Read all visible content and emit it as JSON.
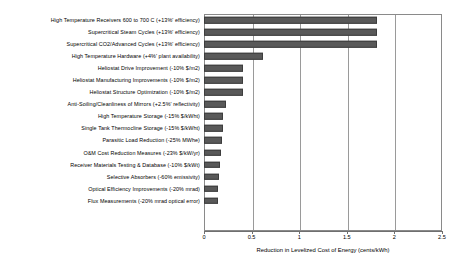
{
  "chart_data": {
    "type": "bar",
    "orientation": "horizontal",
    "title": "",
    "xlabel": "Reduction in Levelized Cost of Energy (cents/kWh)",
    "ylabel": "",
    "xlim": [
      0,
      2.5
    ],
    "xticks": [
      "0",
      "0.5",
      "1",
      "1.5",
      "2",
      "2.5"
    ],
    "xtick_values": [
      0,
      0.5,
      1,
      1.5,
      2,
      2.5
    ],
    "grid": true,
    "grid_axis": "x",
    "legend": "none",
    "bar_color": "#595959",
    "categories": [
      "High Temperature  Receivers 600 to 700 C (+13%' efficiency)",
      "Supercritical Steam Cycles (+13%' efficiency)",
      "Supercritical CO2/Advanced Cycles (+13%' efficiency)",
      "High Temperature  Hardware  (+4%' plant availability)",
      "Heliostat Drive Improvement (-10% $/m2)",
      "Heliostat Manufacturing Improvements (-10% $/m2)",
      "Heliostat Structure Optimization (-10% $/m2)",
      "Anti-Soiling/Cleanliness of Mirrors (+2.5%' reflectivity)",
      "High Temperature  Storage (-15% $/kWht)",
      "Single Tank Thermocline Storage (-15% $/kWht)",
      "Parasitic Load Reduction (-25%  MWhe)",
      "O&M Cost Reduction Measures (-23% $/kW/yr)",
      "Receiver Materials Testing  & Database (-10% $/kWt)",
      "Selective Absorbers (-60% emissivity)",
      "Optical Efficiency Improvements (-20% mrad)",
      "Flux Measurements  (-20% mrad optical error)"
    ],
    "values": [
      1.82,
      1.82,
      1.82,
      0.62,
      0.41,
      0.41,
      0.41,
      0.23,
      0.2,
      0.2,
      0.19,
      0.18,
      0.17,
      0.16,
      0.15,
      0.15
    ]
  }
}
